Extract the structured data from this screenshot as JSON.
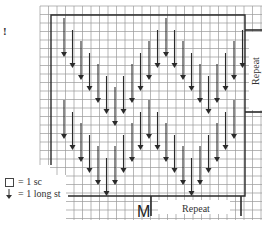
{
  "diagram": {
    "type": "crochet-chart",
    "marker_glyph": "!",
    "grid": {
      "x0": 40,
      "y0": 6,
      "x1": 262,
      "y1": 220,
      "cell": 8.5,
      "line_color": "#9a9a9a",
      "outline_color": "#2a2a2a"
    },
    "outline": {
      "left": 51,
      "top": 15,
      "right": 245,
      "bottom": 196,
      "left_bottom": 165
    },
    "arrow_color": "#2a2a2a",
    "arrow_rows": [
      {
        "name": "upper-chevron",
        "start_y": 18,
        "arrows": [
          {
            "x": 64,
            "y1": 18,
            "y2": 57
          },
          {
            "x": 72.5,
            "y1": 30,
            "y2": 68
          },
          {
            "x": 81,
            "y1": 41,
            "y2": 80
          },
          {
            "x": 89.5,
            "y1": 53,
            "y2": 91
          },
          {
            "x": 98,
            "y1": 64,
            "y2": 103
          },
          {
            "x": 106.5,
            "y1": 76,
            "y2": 114
          },
          {
            "x": 115,
            "y1": 87,
            "y2": 126
          },
          {
            "x": 123.5,
            "y1": 76,
            "y2": 114
          },
          {
            "x": 132,
            "y1": 64,
            "y2": 103
          },
          {
            "x": 140.5,
            "y1": 53,
            "y2": 91
          },
          {
            "x": 149,
            "y1": 41,
            "y2": 80
          },
          {
            "x": 157.5,
            "y1": 30,
            "y2": 68
          },
          {
            "x": 166,
            "y1": 18,
            "y2": 57
          },
          {
            "x": 174.5,
            "y1": 30,
            "y2": 68
          },
          {
            "x": 183,
            "y1": 41,
            "y2": 80
          },
          {
            "x": 191.5,
            "y1": 53,
            "y2": 91
          },
          {
            "x": 200,
            "y1": 64,
            "y2": 103
          },
          {
            "x": 208.5,
            "y1": 76,
            "y2": 114
          },
          {
            "x": 217,
            "y1": 64,
            "y2": 103
          },
          {
            "x": 225.5,
            "y1": 53,
            "y2": 91
          },
          {
            "x": 234,
            "y1": 41,
            "y2": 80
          },
          {
            "x": 242.5,
            "y1": 30,
            "y2": 68
          }
        ]
      },
      {
        "name": "lower-chevron",
        "arrows": [
          {
            "x": 64,
            "y1": 100,
            "y2": 139
          },
          {
            "x": 72.5,
            "y1": 112,
            "y2": 150
          },
          {
            "x": 81,
            "y1": 123,
            "y2": 162
          },
          {
            "x": 89.5,
            "y1": 135,
            "y2": 173
          },
          {
            "x": 98,
            "y1": 146,
            "y2": 185
          },
          {
            "x": 106.5,
            "y1": 158,
            "y2": 196
          },
          {
            "x": 115,
            "y1": 146,
            "y2": 185
          },
          {
            "x": 123.5,
            "y1": 135,
            "y2": 173
          },
          {
            "x": 132,
            "y1": 123,
            "y2": 162
          },
          {
            "x": 140.5,
            "y1": 112,
            "y2": 150
          },
          {
            "x": 149,
            "y1": 100,
            "y2": 139
          },
          {
            "x": 157.5,
            "y1": 112,
            "y2": 150
          },
          {
            "x": 166,
            "y1": 123,
            "y2": 162
          },
          {
            "x": 174.5,
            "y1": 135,
            "y2": 173
          },
          {
            "x": 183,
            "y1": 146,
            "y2": 185
          },
          {
            "x": 191.5,
            "y1": 158,
            "y2": 196
          },
          {
            "x": 200,
            "y1": 146,
            "y2": 185
          },
          {
            "x": 208.5,
            "y1": 135,
            "y2": 173
          },
          {
            "x": 217,
            "y1": 123,
            "y2": 162
          },
          {
            "x": 225.5,
            "y1": 112,
            "y2": 150
          },
          {
            "x": 234,
            "y1": 100,
            "y2": 139
          }
        ]
      }
    ],
    "repeat_right": {
      "label": "Repeat",
      "y_top": 30,
      "y_bottom": 112,
      "x": 245,
      "x2": 262
    },
    "repeat_bottom": {
      "label": "Repeat",
      "x_left": 151,
      "x_right": 241,
      "y": 196,
      "y2": 216
    },
    "m_label": "M",
    "legend": {
      "items": [
        {
          "symbol": "square",
          "text": "= 1 sc"
        },
        {
          "symbol": "down-arrow",
          "text": "= 1 long st"
        }
      ]
    }
  }
}
